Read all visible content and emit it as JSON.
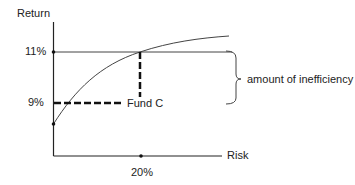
{
  "diagram": {
    "y_axis_label": "Return",
    "x_axis_label": "Risk",
    "y_ticks": [
      {
        "label": "11%",
        "y": 52
      },
      {
        "label": "9%",
        "y": 103
      }
    ],
    "x_ticks": [
      {
        "label": "20%",
        "x": 141
      }
    ],
    "point_label": "Fund C",
    "brace_label": "amount of inefficiency",
    "colors": {
      "line": "#222222",
      "background": "#ffffff"
    }
  }
}
